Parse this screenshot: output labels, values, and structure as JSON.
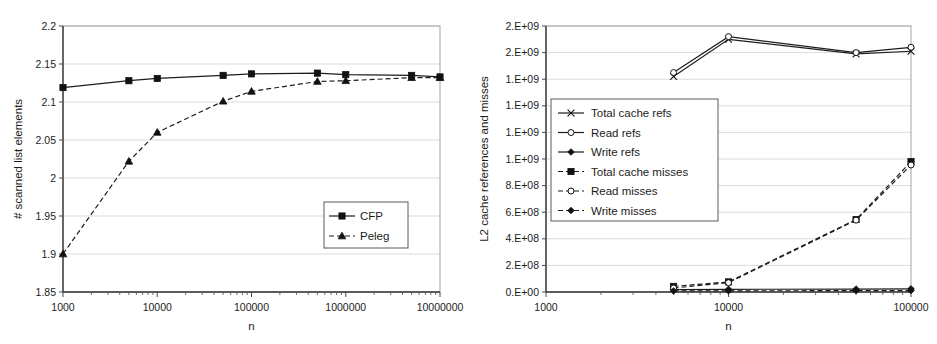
{
  "figure": {
    "name": "two-panel-performance-figure",
    "panels": [
      "left",
      "right"
    ]
  },
  "chart_data": [
    {
      "id": "left",
      "type": "line",
      "title": "",
      "xlabel": "n",
      "ylabel": "# scanned list elements",
      "xscale": "log",
      "yscale": "linear",
      "xlim": [
        1000,
        10000000
      ],
      "ylim": [
        1.85,
        2.2
      ],
      "grid": true,
      "legend_position": "inside-lower-right",
      "xticks": [
        "1000",
        "10000",
        "100000",
        "1000000",
        "10000000"
      ],
      "xtick_values": [
        1000,
        10000,
        100000,
        1000000,
        10000000
      ],
      "yticks": [
        "1.85",
        "1.9",
        "1.95",
        "2",
        "2.05",
        "2.1",
        "2.15",
        "2.2"
      ],
      "ytick_values": [
        1.85,
        1.9,
        1.95,
        2.0,
        2.05,
        2.1,
        2.15,
        2.2
      ],
      "x": [
        1000,
        5000,
        10000,
        50000,
        100000,
        500000,
        1000000,
        5000000,
        10000000
      ],
      "series": [
        {
          "name": "CFP",
          "marker": "square-filled",
          "linestyle": "solid",
          "values": [
            2.119,
            2.128,
            2.131,
            2.135,
            2.137,
            2.138,
            2.136,
            2.135,
            2.133
          ]
        },
        {
          "name": "Peleg",
          "marker": "triangle-filled",
          "linestyle": "dashed",
          "values": [
            1.9,
            2.022,
            2.06,
            2.101,
            2.114,
            2.127,
            2.128,
            2.132,
            2.132
          ]
        }
      ]
    },
    {
      "id": "right",
      "type": "line",
      "title": "",
      "xlabel": "n",
      "ylabel": "L2 cache references and misses",
      "xscale": "log",
      "yscale": "linear",
      "xlim": [
        1000,
        100000
      ],
      "ylim": [
        0,
        2000000000
      ],
      "grid": true,
      "legend_position": "inside-middle-left",
      "xticks": [
        "1000",
        "10000",
        "100000"
      ],
      "xtick_values": [
        1000,
        10000,
        100000
      ],
      "yticks": [
        "0.E+00",
        "2.E+08",
        "4.E+08",
        "6.E+08",
        "8.E+08",
        "1.E+09",
        "1.E+09",
        "1.E+09",
        "1.E+09",
        "2.E+09",
        "2.E+09"
      ],
      "ytick_values": [
        0,
        200000000,
        400000000,
        600000000,
        800000000,
        1000000000,
        1200000000,
        1400000000,
        1600000000,
        1800000000,
        2000000000
      ],
      "x": [
        5000,
        10000,
        50000,
        100000
      ],
      "series": [
        {
          "name": "Total cache refs",
          "marker": "x",
          "linestyle": "solid",
          "values": [
            1620000000,
            1900000000,
            1790000000,
            1810000000
          ]
        },
        {
          "name": "Read refs",
          "marker": "circle-open",
          "linestyle": "solid",
          "values": [
            1650000000,
            1920000000,
            1800000000,
            1840000000
          ]
        },
        {
          "name": "Write refs",
          "marker": "diamond-filled",
          "linestyle": "solid",
          "values": [
            18000000,
            20000000,
            22000000,
            24000000
          ]
        },
        {
          "name": "Total cache misses",
          "marker": "square-filled",
          "linestyle": "dashed",
          "values": [
            42000000,
            76000000,
            545000000,
            980000000
          ]
        },
        {
          "name": "Read misses",
          "marker": "circle-open",
          "linestyle": "dashed",
          "values": [
            30000000,
            70000000,
            540000000,
            955000000
          ]
        },
        {
          "name": "Write misses",
          "marker": "diamond-filled",
          "linestyle": "dashed",
          "values": [
            8000000,
            9000000,
            10000000,
            11000000
          ]
        }
      ]
    }
  ],
  "left_panel": {
    "ylabel": "# scanned list elements",
    "xlabel": "n",
    "ytick_labels": [
      "2.2",
      "2.15",
      "2.1",
      "2.05",
      "2",
      "1.95",
      "1.9",
      "1.85"
    ],
    "xtick_labels": [
      "1000",
      "10000",
      "100000",
      "1000000",
      "10000000"
    ],
    "legend": [
      {
        "label": "CFP",
        "marker": "square-filled",
        "linestyle": "solid"
      },
      {
        "label": "Peleg",
        "marker": "triangle-filled",
        "linestyle": "dashed"
      }
    ]
  },
  "right_panel": {
    "ylabel": "L2 cache references and misses",
    "xlabel": "n",
    "ytick_labels": [
      "2.E+09",
      "2.E+09",
      "1.E+09",
      "1.E+09",
      "1.E+09",
      "8.E+08",
      "6.E+08",
      "4.E+08",
      "2.E+08",
      "0.E+00"
    ],
    "xtick_labels": [
      "1000",
      "10000",
      "100000"
    ],
    "legend": [
      {
        "label": "Total cache refs",
        "marker": "x",
        "linestyle": "solid"
      },
      {
        "label": "Read refs",
        "marker": "circle-open",
        "linestyle": "solid"
      },
      {
        "label": "Write refs",
        "marker": "diamond-filled",
        "linestyle": "solid"
      },
      {
        "label": "Total cache misses",
        "marker": "square-filled",
        "linestyle": "dashed"
      },
      {
        "label": "Read misses",
        "marker": "circle-open",
        "linestyle": "dashed"
      },
      {
        "label": "Write misses",
        "marker": "diamond-filled",
        "linestyle": "dashed"
      }
    ]
  },
  "colors": {
    "ink": "#1c1c1c",
    "grid": "#d2d2d2",
    "axis": "#3a3a3a",
    "background": "#ffffff"
  }
}
